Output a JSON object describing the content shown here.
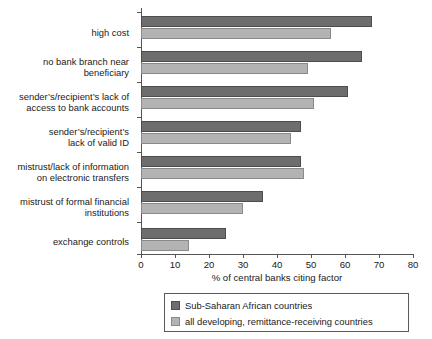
{
  "chart_data": {
    "type": "bar",
    "orientation": "horizontal",
    "title": "",
    "xlabel": "% of central banks citing factor",
    "ylabel": "",
    "xlim": [
      0,
      80
    ],
    "xticks": [
      0,
      10,
      20,
      30,
      40,
      50,
      60,
      70,
      80
    ],
    "grid": false,
    "legend_position": "bottom",
    "categories": [
      "high cost",
      "no bank branch near\nbeneficiary",
      "sender’s/recipient’s lack of\naccess to bank accounts",
      "sender’s/recipient’s\nlack of valid ID",
      "mistrust/lack of information\non electronic transfers",
      "mistrust of formal financial\ninstitutions",
      "exchange controls"
    ],
    "series": [
      {
        "name": "Sub-Saharan African countries",
        "color": "#6d6d6d",
        "values": [
          68,
          65,
          61,
          47,
          47,
          36,
          25
        ]
      },
      {
        "name": "all developing, remittance-receiving countries",
        "color": "#b3b3b3",
        "values": [
          56,
          49,
          51,
          44,
          48,
          30,
          14
        ]
      }
    ]
  },
  "axis": {
    "x_title": "% of central banks citing factor",
    "tick_labels": [
      "0",
      "10",
      "20",
      "30",
      "40",
      "50",
      "60",
      "70",
      "80"
    ]
  },
  "legend": {
    "entries": [
      {
        "label": "Sub-Saharan African countries",
        "swatch": "dark"
      },
      {
        "label": "all developing, remittance-receiving countries",
        "swatch": "light"
      }
    ]
  }
}
